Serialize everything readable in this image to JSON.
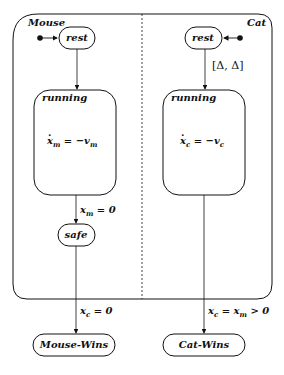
{
  "diagram": {
    "type": "statechart",
    "components": [
      {
        "name": "Mouse",
        "states": [
          {
            "id": "mouse-rest",
            "label": "rest",
            "initial": true
          },
          {
            "id": "mouse-running",
            "label": "running",
            "flow": "ẋm = −vm"
          },
          {
            "id": "mouse-safe",
            "label": "safe"
          }
        ],
        "transitions": [
          {
            "from": "mouse-rest",
            "to": "mouse-running",
            "label": ""
          },
          {
            "from": "mouse-running",
            "to": "mouse-safe",
            "label": "xm = 0"
          }
        ]
      },
      {
        "name": "Cat",
        "states": [
          {
            "id": "cat-rest",
            "label": "rest",
            "initial": true
          },
          {
            "id": "cat-running",
            "label": "running",
            "flow": "ẋc = −vc"
          }
        ],
        "transitions": [
          {
            "from": "cat-rest",
            "to": "cat-running",
            "label": "[Δ, Δ]"
          }
        ]
      }
    ],
    "outcomes": [
      {
        "id": "mouse-wins",
        "label": "Mouse-Wins",
        "guard": "xc = 0"
      },
      {
        "id": "cat-wins",
        "label": "Cat-Wins",
        "guard": "xc = xm > 0"
      }
    ]
  },
  "labels": {
    "mouse": "Mouse",
    "cat": "Cat",
    "rest": "rest",
    "running": "running",
    "safe": "safe",
    "mouse_wins": "Mouse-Wins",
    "cat_wins": "Cat-Wins",
    "delay": "[Δ, Δ]"
  },
  "math": {
    "mouse_flow_lhs": "x",
    "mouse_flow_sub": "m",
    "mouse_flow_rhs": " = −v",
    "mouse_flow_rhs_sub": "m",
    "cat_flow_lhs": "x",
    "cat_flow_sub": "c",
    "cat_flow_rhs": " = −v",
    "cat_flow_rhs_sub": "c",
    "mouse_safe_guard": "x",
    "mouse_safe_guard_sub": "m",
    "mouse_safe_guard_rest": " = 0",
    "mouse_wins_guard": "x",
    "mouse_wins_guard_sub": "c",
    "mouse_wins_guard_rest": " = 0",
    "cat_wins_guard_a": "x",
    "cat_wins_guard_a_sub": "c",
    "cat_wins_guard_mid": " = x",
    "cat_wins_guard_b_sub": "m",
    "cat_wins_guard_rest": " > 0"
  },
  "colors": {
    "stroke": "#111111",
    "background": "#ffffff"
  }
}
